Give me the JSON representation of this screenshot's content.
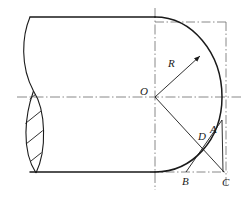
{
  "figure": {
    "type": "engineering-drawing",
    "background_color": "#ffffff",
    "line_color": "#1a1a1a",
    "centerline_color": "#6b6b6b"
  },
  "labels": {
    "center": {
      "text": "O",
      "x": 140,
      "y": 86
    },
    "radius": {
      "text": "R",
      "x": 168,
      "y": 58
    },
    "point_a": {
      "text": "A",
      "x": 210,
      "y": 124
    },
    "point_d": {
      "text": "D",
      "x": 198,
      "y": 131
    },
    "point_b": {
      "text": "B",
      "x": 182,
      "y": 176
    },
    "point_c": {
      "text": "C",
      "x": 222,
      "y": 177
    }
  },
  "geometry": {
    "center_point": {
      "x": 155,
      "y": 97
    },
    "radius_px": 67,
    "arc_top_tangent": {
      "x": 155,
      "y": 17
    },
    "arc_right_extreme": {
      "x": 222,
      "y": 97
    },
    "arc_bottom_tangent": {
      "x": 155,
      "y": 172
    },
    "point_a_coord": {
      "x": 222,
      "y": 120
    },
    "point_b_coord": {
      "x": 186,
      "y": 172
    },
    "point_c_coord": {
      "x": 222,
      "y": 172
    },
    "point_d_coord": {
      "x": 200,
      "y": 139
    },
    "radius_arrow_tip": {
      "x": 200,
      "y": 56
    },
    "body_top_edge_y": 17,
    "body_bottom_edge_y": 172,
    "body_left_x": 30,
    "horizontal_centerline_y": 97,
    "vertical_centerline_x": 155,
    "bounding_box_right_x": 226,
    "bounding_box_top_y": 22,
    "bounding_box_bottom_y": 172,
    "section_hatch_lines": 5,
    "section_lens_left_x": 21,
    "section_lens_right_x": 46
  }
}
